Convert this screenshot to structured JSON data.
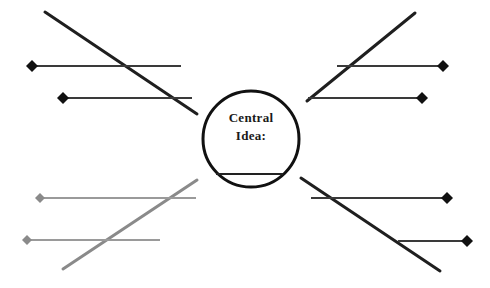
{
  "diagram": {
    "type": "web-graphic-organizer",
    "background_color": "#ffffff",
    "center": {
      "label_line_1": "Central",
      "label_line_2": "Idea:",
      "shape": "circle",
      "cx": 251,
      "cy": 139,
      "r": 48,
      "stroke_color": "#111111",
      "stroke_width": 3,
      "fill": "#ffffff",
      "write_in_rule": {
        "x1": 216,
        "x2": 283,
        "y": 174,
        "color": "#222222",
        "width": 2
      }
    },
    "colors": {
      "ink_dark": "#1f1f1f",
      "ink_mid": "#3a3a3a",
      "ink_gray": "#8a8a8a",
      "ink_light_gray": "#9a9a9a"
    },
    "branches": [
      {
        "id": "branch-upper-left",
        "orientation": "diagonal",
        "color": "#1f1f1f",
        "width": 3,
        "x1": 45,
        "y1": 12,
        "x2": 197,
        "y2": 114
      },
      {
        "id": "branch-upper-right",
        "orientation": "diagonal",
        "color": "#1f1f1f",
        "width": 3,
        "x1": 415,
        "y1": 13,
        "x2": 307,
        "y2": 101
      },
      {
        "id": "branch-lower-left",
        "orientation": "diagonal",
        "color": "#8a8a8a",
        "width": 3,
        "x1": 63,
        "y1": 269,
        "x2": 197,
        "y2": 180
      },
      {
        "id": "branch-lower-right",
        "orientation": "diagonal",
        "color": "#1f1f1f",
        "width": 3,
        "x1": 440,
        "y1": 271,
        "x2": 301,
        "y2": 178
      }
    ],
    "spokes": [
      {
        "id": "spoke-left-top",
        "color": "#3a3a3a",
        "width": 2,
        "x1": 32,
        "y1": 66,
        "x2": 181,
        "y2": 66,
        "marker": {
          "side": "left",
          "x": 32,
          "y": 66,
          "size": 11,
          "color": "#111111"
        }
      },
      {
        "id": "spoke-left-upper-mid",
        "color": "#3a3a3a",
        "width": 2,
        "x1": 63,
        "y1": 98,
        "x2": 192,
        "y2": 98,
        "marker": {
          "side": "left",
          "x": 63,
          "y": 98,
          "size": 11,
          "color": "#111111"
        }
      },
      {
        "id": "spoke-right-top",
        "color": "#3a3a3a",
        "width": 2,
        "x1": 308,
        "y1": 98,
        "x2": 443,
        "y2": 98,
        "marker": {
          "side": "right",
          "x": 443,
          "y": 66,
          "size": 11,
          "color": "#111111"
        }
      },
      {
        "id": "spoke-right-upper-mid",
        "color": "#3a3a3a",
        "width": 2,
        "x1": 337,
        "y1": 66,
        "x2": 443,
        "y2": 66,
        "marker": {
          "side": "right",
          "x": 422,
          "y": 98,
          "size": 10,
          "color": "#111111"
        }
      },
      {
        "id": "spoke-left-lower",
        "color": "#9a9a9a",
        "width": 2,
        "x1": 40,
        "y1": 198,
        "x2": 196,
        "y2": 198,
        "marker": {
          "side": "left",
          "x": 40,
          "y": 198,
          "size": 10,
          "color": "#8a8a8a"
        }
      },
      {
        "id": "spoke-left-bottom",
        "color": "#9a9a9a",
        "width": 2,
        "x1": 27,
        "y1": 240,
        "x2": 160,
        "y2": 240,
        "marker": {
          "side": "left",
          "x": 27,
          "y": 240,
          "size": 10,
          "color": "#8a8a8a"
        }
      },
      {
        "id": "spoke-right-lower",
        "color": "#3a3a3a",
        "width": 2,
        "x1": 311,
        "y1": 198,
        "x2": 447,
        "y2": 198,
        "marker": {
          "side": "right",
          "x": 447,
          "y": 198,
          "size": 10,
          "color": "#111111"
        }
      },
      {
        "id": "spoke-right-bottom",
        "color": "#3a3a3a",
        "width": 2,
        "x1": 398,
        "y1": 241,
        "x2": 467,
        "y2": 241,
        "marker": {
          "side": "right",
          "x": 467,
          "y": 241,
          "size": 10,
          "color": "#111111"
        }
      }
    ]
  }
}
